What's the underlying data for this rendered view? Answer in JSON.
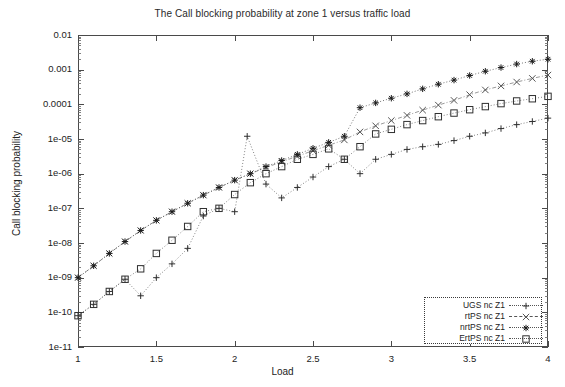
{
  "chart_data": {
    "type": "scatter",
    "title": "The Call blocking probability at zone 1 versus traffic load",
    "xlabel": "Load",
    "ylabel": "Call blocking probability",
    "xscale": "linear",
    "yscale": "log",
    "xlim": [
      1,
      4
    ],
    "ylim": [
      1e-11,
      0.01
    ],
    "grid": false,
    "legend_position": "bottom-right",
    "xticks": [
      "1",
      "1.5",
      "2",
      "2.5",
      "3",
      "3.5",
      "4"
    ],
    "xtick_values": [
      1,
      1.5,
      2,
      2.5,
      3,
      3.5,
      4
    ],
    "yticks": [
      "0.01",
      "0.001",
      "0.0001",
      "1e-05",
      "1e-06",
      "1e-07",
      "1e-08",
      "1e-09",
      "1e-10",
      "1e-11"
    ],
    "ytick_values": [
      0.01,
      0.001,
      0.0001,
      1e-05,
      1e-06,
      1e-07,
      1e-08,
      1e-09,
      1e-10,
      1e-11
    ],
    "series": [
      {
        "name": "UGS nc Z1",
        "marker": "plus",
        "color": "#303030",
        "linestyle": "dotted",
        "x": [
          1.0,
          1.1,
          1.2,
          1.3,
          1.4,
          1.5,
          1.6,
          1.7,
          1.8,
          1.9,
          2.0,
          2.08,
          2.2,
          2.3,
          2.4,
          2.5,
          2.6,
          2.7,
          2.8,
          2.9,
          3.0,
          3.1,
          3.2,
          3.3,
          3.4,
          3.5,
          3.6,
          3.7,
          3.8,
          3.9,
          4.0
        ],
        "y": [
          8e-11,
          1.7e-10,
          4e-10,
          9e-10,
          3e-10,
          1e-09,
          2.5e-09,
          7e-09,
          6e-08,
          1e-07,
          8e-08,
          1.2e-05,
          5e-07,
          2e-07,
          4e-07,
          8e-07,
          1.6e-06,
          2.6e-06,
          1e-06,
          2.6e-06,
          3.6e-06,
          5e-06,
          6e-06,
          7e-06,
          9e-06,
          1.2e-05,
          1.5e-05,
          2e-05,
          2.6e-05,
          3.2e-05,
          4e-05
        ]
      },
      {
        "name": "rtPS nc Z1",
        "marker": "cross",
        "color": "#555555",
        "linestyle": "dashdot",
        "x": [
          1.0,
          1.1,
          1.2,
          1.3,
          1.4,
          1.5,
          1.6,
          1.7,
          1.8,
          1.9,
          2.0,
          2.1,
          2.2,
          2.3,
          2.4,
          2.5,
          2.6,
          2.7,
          2.8,
          2.9,
          3.0,
          3.1,
          3.2,
          3.3,
          3.4,
          3.5,
          3.6,
          3.7,
          3.8,
          3.9,
          4.0
        ],
        "y": [
          1e-09,
          2.2e-09,
          5e-09,
          1.1e-08,
          2.3e-08,
          4.5e-08,
          8e-08,
          1.4e-07,
          2.4e-07,
          4e-07,
          6.5e-07,
          1e-06,
          1.5e-06,
          2.2e-06,
          3.2e-06,
          4.6e-06,
          6.6e-06,
          9.4e-06,
          1.6e-05,
          2.4e-05,
          3.4e-05,
          4.8e-05,
          6.8e-05,
          9.5e-05,
          0.00013,
          0.00019,
          0.00026,
          0.00034,
          0.00044,
          0.00056,
          0.0007
        ]
      },
      {
        "name": "nrtPS nc Z1",
        "marker": "star",
        "color": "#1a1a1a",
        "linestyle": "dotted",
        "x": [
          1.0,
          1.1,
          1.2,
          1.3,
          1.4,
          1.5,
          1.6,
          1.7,
          1.8,
          1.9,
          2.0,
          2.1,
          2.2,
          2.3,
          2.4,
          2.5,
          2.6,
          2.7,
          2.8,
          2.9,
          3.0,
          3.1,
          3.2,
          3.3,
          3.4,
          3.5,
          3.6,
          3.7,
          3.8,
          3.9,
          4.0
        ],
        "y": [
          1e-09,
          2.2e-09,
          5e-09,
          1.1e-08,
          2.3e-08,
          4.5e-08,
          8e-08,
          1.4e-07,
          2.4e-07,
          4e-07,
          6.5e-07,
          1e-06,
          1.6e-06,
          2.4e-06,
          3.6e-06,
          5.4e-06,
          8e-06,
          1.2e-05,
          8e-05,
          0.00011,
          0.00015,
          0.0002,
          0.00028,
          0.00038,
          0.0005,
          0.00068,
          0.0009,
          0.00115,
          0.00145,
          0.00175,
          0.002
        ]
      },
      {
        "name": "ErtPS nc Z1",
        "marker": "square",
        "color": "#303030",
        "linestyle": "dotted",
        "x": [
          1.0,
          1.1,
          1.2,
          1.3,
          1.4,
          1.5,
          1.6,
          1.7,
          1.8,
          1.9,
          2.0,
          2.1,
          2.2,
          2.3,
          2.4,
          2.5,
          2.6,
          2.7,
          2.8,
          2.9,
          3.0,
          3.1,
          3.2,
          3.3,
          3.4,
          3.5,
          3.6,
          3.7,
          3.8,
          3.9,
          4.0
        ],
        "y": [
          8e-11,
          1.7e-10,
          4e-10,
          9e-10,
          1.8e-09,
          5e-09,
          1.2e-08,
          3e-08,
          8e-08,
          1e-07,
          2.5e-07,
          5.5e-07,
          1e-06,
          1.6e-06,
          2.6e-06,
          3.6e-06,
          5.2e-06,
          2.6e-06,
          6e-06,
          1.4e-05,
          1.9e-05,
          2.6e-05,
          3.4e-05,
          4.4e-05,
          5.6e-05,
          7e-05,
          8.6e-05,
          0.000105,
          0.000125,
          0.000145,
          0.00017
        ]
      }
    ]
  },
  "legend": {
    "items": [
      {
        "label": "UGS nc Z1",
        "marker": "+"
      },
      {
        "label": "rtPS nc Z1",
        "marker": "×"
      },
      {
        "label": "nrtPS nc Z1",
        "marker": "✳"
      },
      {
        "label": "ErtPS nc Z1",
        "marker": "□"
      }
    ]
  }
}
